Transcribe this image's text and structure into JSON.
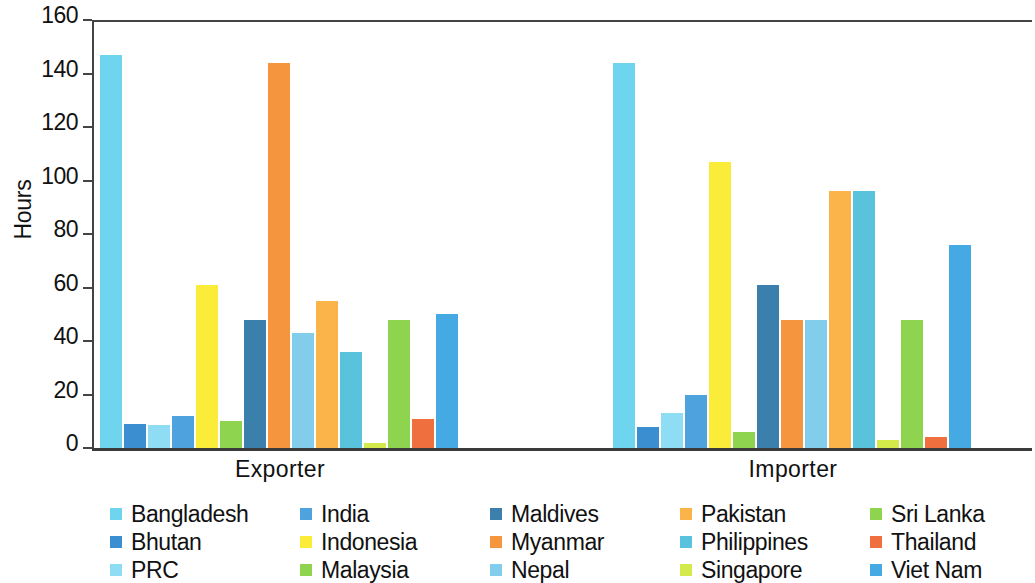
{
  "chart_data": {
    "type": "bar",
    "title": "",
    "subtitle": "",
    "xlabel": "",
    "ylabel": "Hours",
    "ylim": [
      0,
      160
    ],
    "yticks": [
      "0",
      "20",
      "40",
      "60",
      "80",
      "100",
      "120",
      "140",
      "160"
    ],
    "grid": false,
    "legend_position": "bottom",
    "categories": [
      "Exporter",
      "Importer"
    ],
    "series": [
      {
        "name": "Bangladesh",
        "color": "#6fd5ef",
        "values": [
          147,
          144
        ]
      },
      {
        "name": "Bhutan",
        "color": "#3b8fd0",
        "values": [
          9,
          8
        ]
      },
      {
        "name": "PRC",
        "color": "#8fdcf5",
        "values": [
          8.5,
          13
        ]
      },
      {
        "name": "India",
        "color": "#4ea3de",
        "values": [
          12,
          20
        ]
      },
      {
        "name": "Indonesia",
        "color": "#fbec3a",
        "values": [
          61,
          107
        ]
      },
      {
        "name": "Malaysia",
        "color": "#8ed44e",
        "values": [
          10,
          6
        ]
      },
      {
        "name": "Maldives",
        "color": "#3b7fac",
        "values": [
          48,
          61
        ]
      },
      {
        "name": "Myanmar",
        "color": "#f5963f",
        "values": [
          144,
          48
        ]
      },
      {
        "name": "Nepal",
        "color": "#82cdec",
        "values": [
          43,
          48
        ]
      },
      {
        "name": "Pakistan",
        "color": "#fbb44a",
        "values": [
          55,
          96
        ]
      },
      {
        "name": "Philippines",
        "color": "#59c2dc",
        "values": [
          36,
          96
        ]
      },
      {
        "name": "Singapore",
        "color": "#d4e94a",
        "values": [
          2,
          3
        ]
      },
      {
        "name": "Sri Lanka",
        "color": "#8ed44e",
        "values": [
          48,
          48
        ]
      },
      {
        "name": "Thailand",
        "color": "#ef6f3f",
        "values": [
          11,
          4
        ]
      },
      {
        "name": "Viet Nam",
        "color": "#45a9e3",
        "values": [
          50,
          76
        ]
      }
    ]
  },
  "axis": {
    "y_title": "Hours",
    "y_ticks": [
      "160",
      "140",
      "120",
      "100",
      "80",
      "60",
      "40",
      "20",
      "0"
    ],
    "x_labels": [
      "Exporter",
      "Importer"
    ]
  },
  "legend": {
    "items": [
      {
        "label": "Bangladesh",
        "color": "#6fd5ef"
      },
      {
        "label": "Bhutan",
        "color": "#3b8fd0"
      },
      {
        "label": "PRC",
        "color": "#8fdcf5"
      },
      {
        "label": "India",
        "color": "#4ea3de"
      },
      {
        "label": "Indonesia",
        "color": "#fbec3a"
      },
      {
        "label": "Malaysia",
        "color": "#8ed44e"
      },
      {
        "label": "Maldives",
        "color": "#3b7fac"
      },
      {
        "label": "Myanmar",
        "color": "#f5963f"
      },
      {
        "label": "Nepal",
        "color": "#82cdec"
      },
      {
        "label": "Pakistan",
        "color": "#fbb44a"
      },
      {
        "label": "Philippines",
        "color": "#59c2dc"
      },
      {
        "label": "Singapore",
        "color": "#d4e94a"
      },
      {
        "label": "Sri Lanka",
        "color": "#8ed44e"
      },
      {
        "label": "Thailand",
        "color": "#ef6f3f"
      },
      {
        "label": "Viet Nam",
        "color": "#45a9e3"
      }
    ]
  }
}
